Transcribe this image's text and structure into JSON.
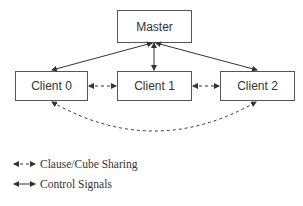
{
  "nodes": {
    "master": {
      "label": "Master"
    },
    "client0": {
      "label": "Client 0"
    },
    "client1": {
      "label": "Client 1"
    },
    "client2": {
      "label": "Client 2"
    }
  },
  "edges": [
    {
      "from": "master",
      "to": "client0",
      "style": "solid",
      "type": "control"
    },
    {
      "from": "master",
      "to": "client1",
      "style": "solid",
      "type": "control"
    },
    {
      "from": "master",
      "to": "client2",
      "style": "solid",
      "type": "control"
    },
    {
      "from": "client0",
      "to": "client1",
      "style": "dashed",
      "type": "sharing"
    },
    {
      "from": "client1",
      "to": "client2",
      "style": "dashed",
      "type": "sharing"
    },
    {
      "from": "client0",
      "to": "client2",
      "style": "dashed-curve",
      "type": "sharing"
    }
  ],
  "legend": {
    "items": [
      {
        "style": "dashed",
        "label": "Clause/Cube Sharing"
      },
      {
        "style": "solid",
        "label": "Control Signals"
      }
    ]
  },
  "colors": {
    "stroke": "#333333",
    "box_border": "#555555",
    "background": "#ffffff"
  }
}
